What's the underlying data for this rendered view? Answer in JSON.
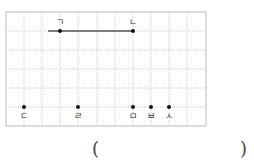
{
  "diagram": {
    "grid": {
      "left": 6,
      "top": 12,
      "right": 206,
      "bottom": 126,
      "cols": [
        24,
        42,
        60,
        78,
        97,
        115,
        133,
        151,
        169,
        187
      ],
      "rows": [
        31,
        50,
        69,
        88,
        107
      ]
    },
    "segment": {
      "x1": 48,
      "y1": 31,
      "x2": 133,
      "y2": 31
    },
    "points": [
      {
        "label": "ㄱ",
        "x": 60,
        "y": 31,
        "lx": 60,
        "ly": 25
      },
      {
        "label": "ㄴ",
        "x": 133,
        "y": 31,
        "lx": 133,
        "ly": 25
      },
      {
        "label": "ㄷ",
        "x": 24,
        "y": 107,
        "lx": 24,
        "ly": 119
      },
      {
        "label": "ㄹ",
        "x": 78,
        "y": 107,
        "lx": 78,
        "ly": 119
      },
      {
        "label": "ㅁ",
        "x": 133,
        "y": 107,
        "lx": 133,
        "ly": 119
      },
      {
        "label": "ㅂ",
        "x": 151,
        "y": 107,
        "lx": 151,
        "ly": 119
      },
      {
        "label": "ㅅ",
        "x": 169,
        "y": 107,
        "lx": 169,
        "ly": 119
      }
    ]
  },
  "answer": {
    "open_paren": "(",
    "close_paren": ")"
  }
}
